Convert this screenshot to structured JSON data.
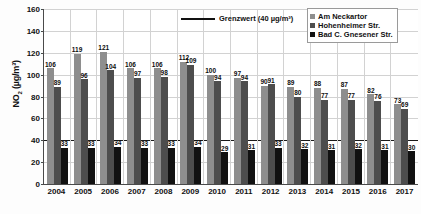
{
  "chart_data": {
    "type": "bar",
    "title": "",
    "xlabel": "",
    "ylabel": "NO2 (µg/m³)",
    "ylim": [
      0,
      160
    ],
    "ytick_step": 20,
    "yticks": [
      "160",
      "140",
      "120",
      "100",
      "80",
      "60",
      "40",
      "20",
      "0"
    ],
    "grid": true,
    "legend_position": "top-right",
    "categories": [
      "2004",
      "2005",
      "2006",
      "2007",
      "2008",
      "2009",
      "2010",
      "2011",
      "2012",
      "2013",
      "2014",
      "2015",
      "2016",
      "2017"
    ],
    "series": [
      {
        "name": "Am Neckartor",
        "color": "#8e8e8e",
        "values": [
          106,
          119,
          121,
          106,
          106,
          112,
          100,
          97,
          90,
          89,
          88,
          87,
          82,
          73
        ]
      },
      {
        "name": "Hohenheimer Str.",
        "color": "#4d4d4d",
        "values": [
          89,
          96,
          104,
          97,
          98,
          109,
          94,
          94,
          91,
          80,
          77,
          77,
          76,
          69
        ]
      },
      {
        "name": "Bad C. Gnesener Str.",
        "color": "#111111",
        "values": [
          33,
          33,
          34,
          33,
          33,
          34,
          29,
          31,
          33,
          32,
          31,
          32,
          31,
          30
        ]
      }
    ],
    "threshold": {
      "label": "Grenzwert (40 µg/m³)",
      "value": 40,
      "color": "#111111"
    }
  },
  "legend": {
    "limit_label": "Grenzwert (40 µg/m³)",
    "entries": [
      {
        "label": "Am Neckartor"
      },
      {
        "label": "Hohenheimer Str."
      },
      {
        "label": "Bad C. Gnesener Str."
      }
    ]
  },
  "axis": {
    "y_title": "NO2 (µg/m³)"
  }
}
